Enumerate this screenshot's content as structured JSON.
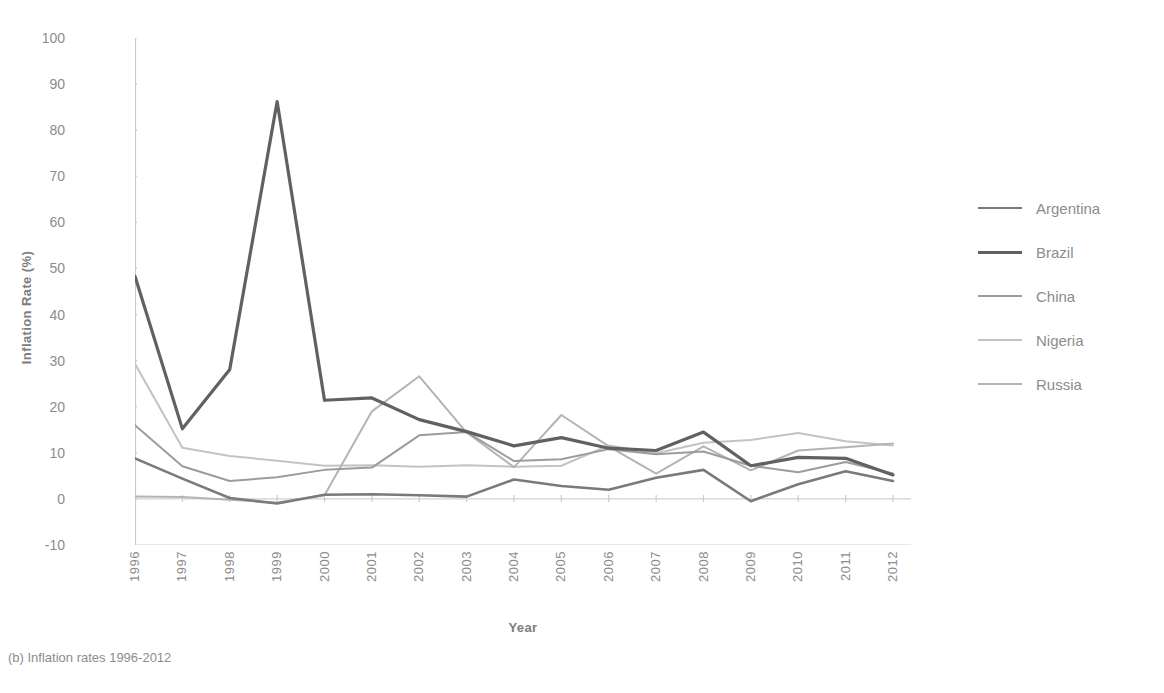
{
  "caption": "(b) Inflation rates 1996-2012",
  "axis": {
    "ylabel": "Inflation Rate (%)",
    "xlabel": "Year",
    "yticks": [
      "100",
      "90",
      "80",
      "70",
      "60",
      "50",
      "40",
      "30",
      "20",
      "10",
      "0",
      "-10"
    ]
  },
  "legend": {
    "position": "right",
    "items": [
      {
        "label": "Argentina",
        "color": "#7a7a7a"
      },
      {
        "label": "Brazil",
        "color": "#616161"
      },
      {
        "label": "China",
        "color": "#9c9c9c"
      },
      {
        "label": "Nigeria",
        "color": "#c3c3c3"
      },
      {
        "label": "Russia",
        "color": "#b4b4b4"
      }
    ]
  },
  "chart_data": {
    "type": "line",
    "title": "",
    "subtitle": "",
    "xlabel": "Year",
    "ylabel": "Inflation Rate (%)",
    "grid": false,
    "legend_position": "right",
    "ylim": [
      -10,
      100
    ],
    "ytick_step": 10,
    "categories": [
      1996,
      1997,
      1998,
      1999,
      2000,
      2001,
      2002,
      2003,
      2004,
      2005,
      2006,
      2007,
      2008,
      2009,
      2010,
      2011,
      2012
    ],
    "x": [
      "1996",
      "1997",
      "1998",
      "1999",
      "2000",
      "2001",
      "2002",
      "2003",
      "2004",
      "2005",
      "2006",
      "2007",
      "2008",
      "2009",
      "2010",
      "2011",
      "2012"
    ],
    "series": [
      {
        "name": "Argentina",
        "color": "#7a7a7a",
        "width": 2.6,
        "values": [
          8.8,
          4.4,
          0.2,
          -1.0,
          0.9,
          1.0,
          0.8,
          0.5,
          4.2,
          2.8,
          2.0,
          4.6,
          6.3,
          -0.5,
          3.2,
          6.0,
          3.9
        ]
      },
      {
        "name": "Brazil",
        "color": "#616161",
        "width": 3.2,
        "values": [
          48.3,
          15.2,
          28.1,
          86.2,
          21.4,
          21.9,
          17.2,
          14.6,
          11.5,
          13.3,
          11.0,
          10.5,
          14.5,
          7.2,
          9.0,
          8.8,
          5.2
        ]
      },
      {
        "name": "China",
        "color": "#9c9c9c",
        "width": 2.0,
        "values": [
          16.0,
          7.1,
          3.9,
          4.7,
          6.3,
          6.8,
          13.8,
          14.5,
          8.2,
          8.6,
          10.8,
          9.7,
          10.3,
          7.2,
          5.8,
          8.0,
          5.5
        ]
      },
      {
        "name": "Nigeria",
        "color": "#c3c3c3",
        "width": 2.0,
        "values": [
          29.3,
          11.1,
          9.3,
          8.3,
          7.2,
          7.3,
          7.0,
          7.3,
          7.0,
          7.2,
          11.6,
          9.9,
          12.2,
          12.8,
          14.3,
          12.5,
          11.6
        ]
      },
      {
        "name": "Russia",
        "color": "#b4b4b4",
        "width": 2.0,
        "values": [
          0.5,
          0.4,
          -0.2,
          -0.8,
          0.8,
          19.0,
          26.6,
          14.4,
          6.9,
          18.2,
          11.4,
          5.5,
          11.4,
          6.2,
          10.5,
          11.2,
          12.0
        ]
      }
    ]
  }
}
